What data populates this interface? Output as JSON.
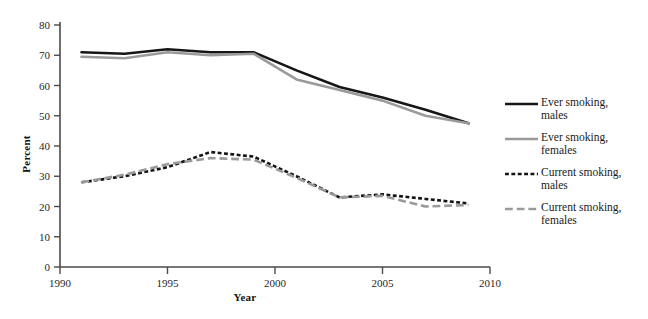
{
  "chart_data": {
    "type": "line",
    "title": "",
    "xlabel": "Year",
    "ylabel": "Percent",
    "xlim": [
      1990,
      2010
    ],
    "ylim": [
      0,
      80
    ],
    "xticks": [
      1990,
      1995,
      2000,
      2005,
      2010
    ],
    "yticks": [
      0,
      10,
      20,
      30,
      40,
      50,
      60,
      70,
      80
    ],
    "grid": false,
    "legend_position": "right",
    "x": [
      1991,
      1993,
      1995,
      1997,
      1999,
      2001,
      2003,
      2005,
      2007,
      2009
    ],
    "series": [
      {
        "name": "Ever smoking, males",
        "style": "solid",
        "color": "#161616",
        "width": 2.6,
        "values": [
          71,
          70.5,
          72,
          71,
          71,
          65,
          59.5,
          56,
          52,
          47.5
        ]
      },
      {
        "name": "Ever smoking, females",
        "style": "solid",
        "color": "#9a9a9a",
        "width": 2.6,
        "values": [
          69.5,
          69,
          71,
          70,
          70.5,
          62,
          58.5,
          55,
          50,
          47.5
        ]
      },
      {
        "name": "Current smoking, males",
        "style": "dotted",
        "color": "#141414",
        "width": 2.6,
        "values": [
          28,
          30,
          33,
          38,
          36.5,
          30,
          23,
          24,
          22.5,
          21
        ]
      },
      {
        "name": "Current smoking, females",
        "style": "dashed",
        "color": "#9a9a9a",
        "width": 2.6,
        "values": [
          28,
          30.5,
          34,
          36,
          35.5,
          29.5,
          23,
          23.5,
          20,
          20.5
        ]
      }
    ]
  },
  "legend": {
    "items": [
      {
        "label": "Ever smoking,\nmales",
        "icon": "solid-black-line-icon"
      },
      {
        "label": "Ever smoking,\nfemales",
        "icon": "solid-gray-line-icon"
      },
      {
        "label": "Current smoking,\nmales",
        "icon": "dotted-black-line-icon"
      },
      {
        "label": "Current smoking,\nfemales",
        "icon": "dashed-gray-line-icon"
      }
    ]
  },
  "axis_colors": {
    "axis_line": "#4a4a4a",
    "tick_text": "#1f1f1f"
  }
}
